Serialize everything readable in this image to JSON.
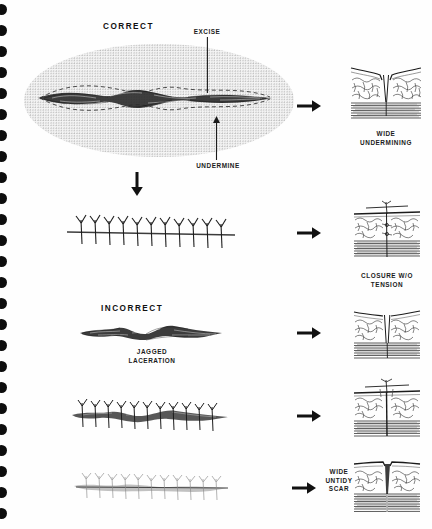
{
  "page": {
    "background_color": "#fefefe",
    "ink_color": "#1b1b1b",
    "binding": {
      "hole_count": 25,
      "hole_color": "#0d0d0d",
      "spacing_px": 21
    }
  },
  "headings": {
    "correct": "CORRECT",
    "incorrect": "INCORRECT"
  },
  "callouts": {
    "excise": "EXCISE",
    "undermine": "UNDERMINE",
    "jagged_laceration": "JAGGED\nLACERATION"
  },
  "panels": [
    {
      "id": "wide-undermining",
      "label": "WIDE\nUNDERMINING",
      "type": "cross-section-open-wide"
    },
    {
      "id": "closure-wo-tension",
      "label": "CLOSURE W/O\nTENSION",
      "type": "cross-section-sutured-clean"
    },
    {
      "id": "jagged-open",
      "label": "",
      "type": "cross-section-open-narrow"
    },
    {
      "id": "jagged-sutured",
      "label": "",
      "type": "cross-section-sutured-rough"
    },
    {
      "id": "wide-untidy-scar",
      "label": "WIDE\nUNTIDY\nSCAR",
      "type": "cross-section-scar"
    }
  ],
  "figures": {
    "excised_ellipse": {
      "name": "elliptical wound with dashed excision outline inside stippled undermined field"
    },
    "closed_suture_row": {
      "name": "row of interrupted sutures on clean closed wound",
      "suture_count": 11
    },
    "jagged_laceration": {
      "name": "irregular jagged laceration, untreated"
    },
    "jagged_suture_row": {
      "name": "row of sutures over unexcised jagged laceration",
      "suture_count": 11
    },
    "untidy_scar_row": {
      "name": "faded wide untidy scar with suture marks",
      "suture_count": 11
    }
  },
  "arrows": {
    "right_glyph": "right-arrow",
    "down_glyph": "down-arrow",
    "count_right": 5,
    "count_down": 1
  }
}
